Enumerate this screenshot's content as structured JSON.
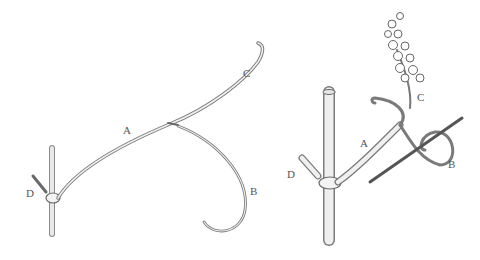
{
  "figure": {
    "left": {
      "labels": {
        "A": "A",
        "B": "B",
        "C": "C",
        "D": "D"
      }
    },
    "right": {
      "labels": {
        "A": "A",
        "B": "B",
        "C": "C",
        "D": "D"
      }
    }
  },
  "colors": {
    "ink": "#666666",
    "background": "#ffffff"
  }
}
